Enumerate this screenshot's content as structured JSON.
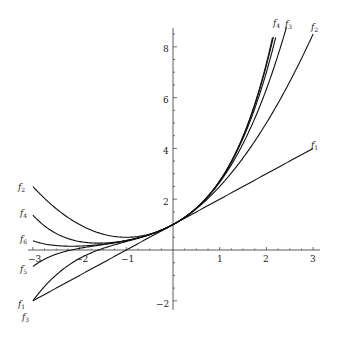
{
  "chart_data": {
    "type": "line",
    "title": "",
    "xlabel": "",
    "ylabel": "",
    "xlim": [
      -3,
      3
    ],
    "ylim": [
      -2.3,
      8.8
    ],
    "grid": false,
    "legend": "none (curves labeled inline at ends)",
    "x_ticks": [
      -3,
      -2,
      -1,
      1,
      2,
      3
    ],
    "y_ticks": [
      -2,
      2,
      4,
      6,
      8
    ],
    "x_tick_labels": [
      "−3",
      "−2",
      "−1",
      "1",
      "2",
      "3"
    ],
    "y_tick_labels": [
      "−2",
      "2",
      "4",
      "6",
      "8"
    ],
    "series": [
      {
        "name": "f1",
        "degree": 1,
        "x": [
          -3,
          3
        ],
        "values": [
          -2,
          4
        ]
      },
      {
        "name": "f2",
        "degree": 2,
        "x": [
          -3,
          -2,
          -1,
          0,
          1,
          2,
          3
        ],
        "values": [
          2.5,
          1,
          0.5,
          1,
          2.5,
          5,
          8.5
        ]
      },
      {
        "name": "f3",
        "degree": 3,
        "x": [
          -3,
          -2,
          -1,
          0,
          1,
          2,
          2.43
        ],
        "values": [
          -2,
          -0.33,
          0.33,
          1,
          2.67,
          6.33,
          8.8
        ]
      },
      {
        "name": "f4",
        "degree": 4,
        "x": [
          -3,
          -2,
          -1,
          0,
          1,
          2,
          2.2
        ],
        "values": [
          1.375,
          0.33,
          0.375,
          1,
          2.71,
          7,
          8.8
        ]
      },
      {
        "name": "f5",
        "degree": 5,
        "x": [
          -3,
          -2,
          -1,
          0,
          1,
          2,
          2.15
        ],
        "values": [
          -0.65,
          0.07,
          0.37,
          1,
          2.72,
          7.27,
          8.8
        ]
      },
      {
        "name": "f6",
        "degree": 6,
        "x": [
          -3,
          -2,
          -1,
          0,
          1,
          2,
          2.13
        ],
        "values": [
          0.36,
          0.16,
          0.37,
          1,
          2.72,
          7.36,
          8.8
        ]
      }
    ],
    "annotations": {
      "right_top": [
        "f4",
        "f3",
        "f2"
      ],
      "right_mid": [
        "f1"
      ],
      "left": [
        "f2",
        "f4",
        "f6",
        "f5",
        "f1",
        "f3"
      ]
    }
  },
  "labels": {
    "x": {
      "m3": "−3",
      "m2": "−2",
      "m1": "−1",
      "p1": "1",
      "p2": "2",
      "p3": "3"
    },
    "y": {
      "m2": "−2",
      "p2": "2",
      "p4": "4",
      "p6": "6",
      "p8": "8"
    },
    "f": "f",
    "n1": "1",
    "n2": "2",
    "n3": "3",
    "n4": "4",
    "n5": "5",
    "n6": "6"
  },
  "colors": {
    "curve": "#111111",
    "axis": "#333333",
    "background": "#ffffff"
  }
}
